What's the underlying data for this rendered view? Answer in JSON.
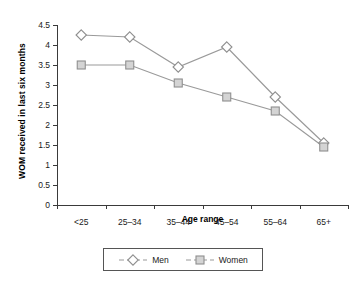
{
  "chart_data": {
    "type": "line",
    "title": "",
    "xlabel": "Age range",
    "ylabel": "WOM received in last six months",
    "categories": [
      "<25",
      "25–34",
      "35–44",
      "45–54",
      "55–64",
      "65+"
    ],
    "series": [
      {
        "name": "Men",
        "marker": "open-diamond",
        "color": "#9a9a9a",
        "values": [
          4.25,
          4.2,
          3.45,
          3.95,
          2.7,
          1.55
        ]
      },
      {
        "name": "Women",
        "marker": "filled-square",
        "color": "#9a9a9a",
        "values": [
          3.5,
          3.5,
          3.05,
          2.7,
          2.35,
          1.45
        ]
      }
    ],
    "ylim": [
      0,
      4.5
    ],
    "ytick_labels": [
      "0",
      "0.5",
      "1",
      "1.5",
      "2",
      "2.5",
      "3",
      "3.5",
      "4",
      "4.5"
    ],
    "ytick_values": [
      0,
      0.5,
      1,
      1.5,
      2,
      2.5,
      3,
      3.5,
      4,
      4.5
    ],
    "grid": false,
    "legend_position": "bottom",
    "legend_entries": [
      "Men",
      "Women"
    ]
  },
  "colors": {
    "axis": "#3a3a3a",
    "line": "#9a9a9a",
    "marker_fill": "#d4d4d4",
    "marker_edge": "#8f8f8f",
    "legend_border": "#555555",
    "background": "#ffffff"
  }
}
